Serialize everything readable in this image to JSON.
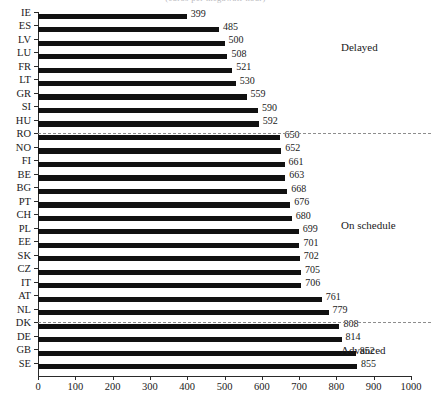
{
  "top_caption": "(euros per megawatt-hour)",
  "chart_data": {
    "type": "bar",
    "orientation": "horizontal",
    "title": "",
    "xlabel": "",
    "ylabel": "",
    "xlim": [
      0,
      1000
    ],
    "xticks": [
      0,
      100,
      200,
      300,
      400,
      500,
      600,
      700,
      800,
      900,
      1000
    ],
    "grid": false,
    "legend_position": "none",
    "bar_color": "#111111",
    "separator_color": "#8d8d8d",
    "categories": [
      "IE",
      "ES",
      "LV",
      "LU",
      "FR",
      "LT",
      "GR",
      "SI",
      "HU",
      "RO",
      "NO",
      "FI",
      "BE",
      "BG",
      "PT",
      "CH",
      "PL",
      "EE",
      "SK",
      "CZ",
      "IT",
      "AT",
      "NL",
      "DK",
      "DE",
      "GB",
      "SE"
    ],
    "values": [
      399,
      485,
      500,
      508,
      521,
      530,
      559,
      590,
      592,
      650,
      652,
      661,
      663,
      668,
      676,
      680,
      699,
      701,
      702,
      705,
      706,
      761,
      779,
      808,
      814,
      852,
      855
    ],
    "annotations": [
      {
        "name": "delayed",
        "label": "Delayed",
        "after_category": null,
        "group_start": "IE",
        "group_end": "HU"
      },
      {
        "name": "on-schedule",
        "label": "On schedule",
        "group_start": "RO",
        "group_end": "NL"
      },
      {
        "name": "advanced",
        "label": "Advanced",
        "group_start": "DK",
        "group_end": "SE"
      }
    ],
    "separators": [
      {
        "name": "delayed-onschedule-divider",
        "between": [
          "HU",
          "RO"
        ]
      },
      {
        "name": "onschedule-advanced-divider",
        "between": [
          "NL",
          "DK"
        ]
      }
    ]
  }
}
